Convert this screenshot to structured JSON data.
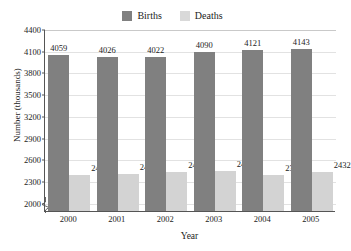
{
  "chart_data": {
    "type": "bar",
    "title": "Number of Births and Deaths in the United States",
    "xlabel": "Year",
    "ylabel": "Number (thousands)",
    "categories": [
      "2000",
      "2001",
      "2002",
      "2003",
      "2004",
      "2005"
    ],
    "series": [
      {
        "name": "Births",
        "color": "#808080",
        "values": [
          4059,
          4026,
          4022,
          4090,
          4121,
          4143
        ]
      },
      {
        "name": "Deaths",
        "color": "#d3d3d3",
        "values": [
          2403,
          2416,
          2443,
          2448,
          2393,
          2432
        ]
      }
    ],
    "ylim": [
      1900,
      4400
    ],
    "yticks": [
      4400,
      4100,
      3800,
      3500,
      3200,
      2900,
      2600,
      2300,
      2000
    ],
    "grid": true,
    "axis_break": true,
    "legend_position": "top-center"
  },
  "legend": {
    "births_label": "Births",
    "deaths_label": "Deaths"
  }
}
